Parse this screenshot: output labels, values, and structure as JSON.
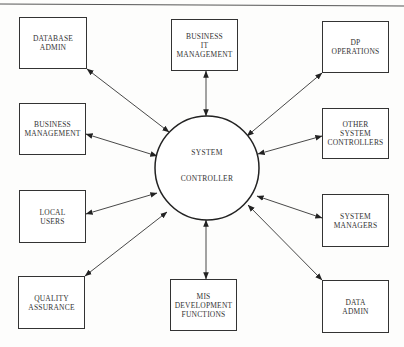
{
  "diagram": {
    "type": "hub-and-spoke",
    "center": {
      "label_line1": "SYSTEM",
      "label_line2": "CONTROLLER",
      "cx": 207,
      "cy": 168,
      "r": 52
    },
    "nodes": [
      {
        "id": "database-admin",
        "label": "DATABASE\nADMIN",
        "x": 19,
        "y": 17,
        "w": 68,
        "h": 52
      },
      {
        "id": "business-it-management",
        "label": "BUSINESS\nIT\nMANAGEMENT",
        "x": 171,
        "y": 19,
        "w": 67,
        "h": 52
      },
      {
        "id": "dp-operations",
        "label": "DP\nOPERATIONS",
        "x": 322,
        "y": 21,
        "w": 67,
        "h": 52
      },
      {
        "id": "business-management",
        "label": "BUSINESS\nMANAGEMENT",
        "x": 19,
        "y": 103,
        "w": 67,
        "h": 52
      },
      {
        "id": "other-system-controllers",
        "label": "OTHER\nSYSTEM\nCONTROLLERS",
        "x": 322,
        "y": 108,
        "w": 67,
        "h": 51
      },
      {
        "id": "local-users",
        "label": "LOCAL\nUSERS",
        "x": 19,
        "y": 190,
        "w": 67,
        "h": 53
      },
      {
        "id": "system-managers",
        "label": "SYSTEM\nMANAGERS",
        "x": 322,
        "y": 194,
        "w": 67,
        "h": 53
      },
      {
        "id": "quality-assurance",
        "label": "QUALITY\nASSURANCE",
        "x": 18,
        "y": 276,
        "w": 67,
        "h": 53
      },
      {
        "id": "mis-development-functions",
        "label": "MIS\nDEVELOPMENT\nFUNCTIONS",
        "x": 170,
        "y": 279,
        "w": 67,
        "h": 52
      },
      {
        "id": "data-admin",
        "label": "DATA\nADMIN",
        "x": 322,
        "y": 280,
        "w": 67,
        "h": 53
      }
    ],
    "edges": [
      {
        "node": "database-admin",
        "x1": 87,
        "y1": 69,
        "x2": 169,
        "y2": 132
      },
      {
        "node": "business-it-management",
        "x1": 206,
        "y1": 71,
        "x2": 206,
        "y2": 116
      },
      {
        "node": "dp-operations",
        "x1": 322,
        "y1": 73,
        "x2": 247,
        "y2": 136
      },
      {
        "node": "business-management",
        "x1": 86,
        "y1": 134,
        "x2": 157,
        "y2": 156
      },
      {
        "node": "other-system-controllers",
        "x1": 322,
        "y1": 136,
        "x2": 258,
        "y2": 154
      },
      {
        "node": "local-users",
        "x1": 86,
        "y1": 214,
        "x2": 157,
        "y2": 193
      },
      {
        "node": "system-managers",
        "x1": 322,
        "y1": 218,
        "x2": 257,
        "y2": 196
      },
      {
        "node": "quality-assurance",
        "x1": 85,
        "y1": 276,
        "x2": 167,
        "y2": 212
      },
      {
        "node": "mis-development-functions",
        "x1": 206,
        "y1": 279,
        "x2": 206,
        "y2": 220
      },
      {
        "node": "data-admin",
        "x1": 322,
        "y1": 280,
        "x2": 248,
        "y2": 205
      }
    ],
    "colors": {
      "line": "#333333",
      "background": "#fdfdfc"
    }
  }
}
